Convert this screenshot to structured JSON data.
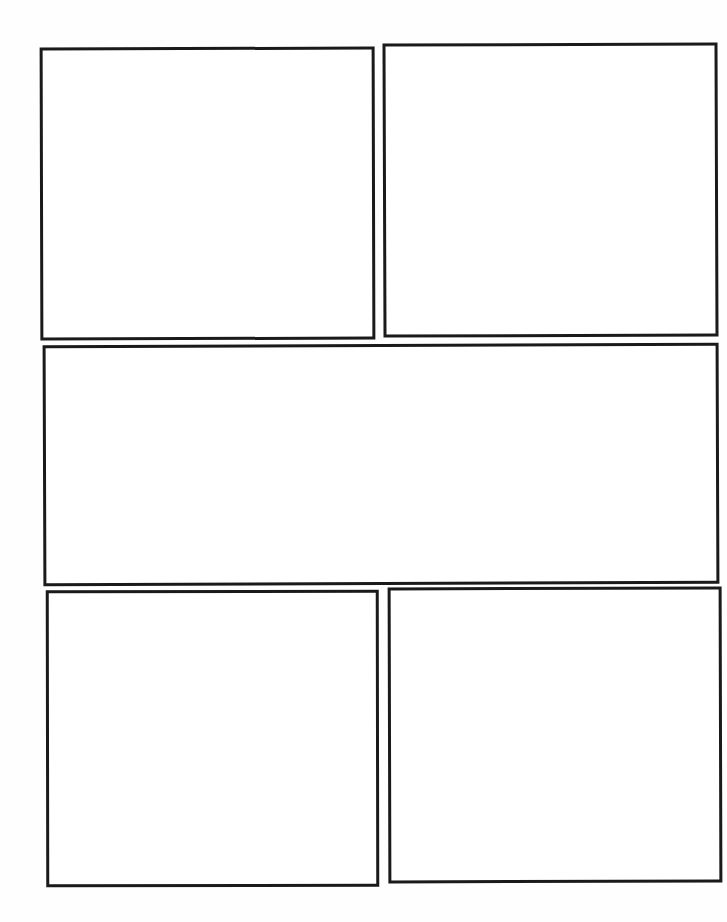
{
  "page": {
    "type": "blank comic page template",
    "background": "#fefefe",
    "border_color": "#1a1a1a",
    "panels": [
      {
        "id": "panel-1",
        "label": ""
      },
      {
        "id": "panel-2",
        "label": ""
      },
      {
        "id": "panel-3",
        "label": ""
      },
      {
        "id": "panel-4",
        "label": ""
      },
      {
        "id": "panel-5",
        "label": ""
      }
    ]
  }
}
